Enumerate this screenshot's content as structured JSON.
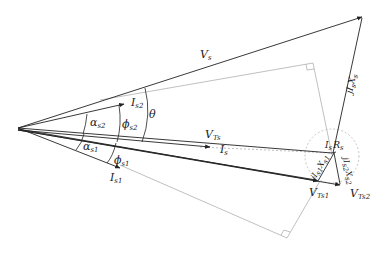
{
  "diagram": {
    "type": "phasor-diagram",
    "labels": {
      "Vs": "V",
      "Vs_sub": "s",
      "Is2": "I",
      "Is2_sub": "s2",
      "Is1": "I",
      "Is1_sub": "s1",
      "Is": "I",
      "Is_sub": "s",
      "alpha_s2": "α",
      "alpha_s2_sub": "s2",
      "alpha_s1": "α",
      "alpha_s1_sub": "s1",
      "phi_s2": "ϕ",
      "phi_s2_sub": "s2",
      "phi_s1": "ϕ",
      "phi_s1_sub": "s1",
      "theta": "θ",
      "VTs": "V",
      "VTs_sub": "Ts",
      "VTs1": "V",
      "VTs1_sub": "Ts1",
      "VTs2": "V",
      "VTs2_sub": "Ts2",
      "IsRs": "I",
      "IsRs_mid": "s",
      "IsRs_R": "R",
      "IsRs_sub": "s",
      "jIsXs": "jI",
      "jIsXs_mid": "s",
      "jIsXs_X": "X",
      "jIsXs_sub": "s",
      "jIs1Xs1": "jI",
      "jIs1Xs1_mid": "s1",
      "jIs1Xs1_X": "X",
      "jIs1Xs1_sub": "s1",
      "jIs2Xs2": "jI",
      "jIs2Xs2_mid": "s2",
      "jIs2Xs2_X": "X",
      "jIs2Xs2_sub": "s2"
    },
    "colors": {
      "line": "#222222",
      "dashed": "#b0b0b0",
      "circle": "#b8b8b8"
    }
  }
}
